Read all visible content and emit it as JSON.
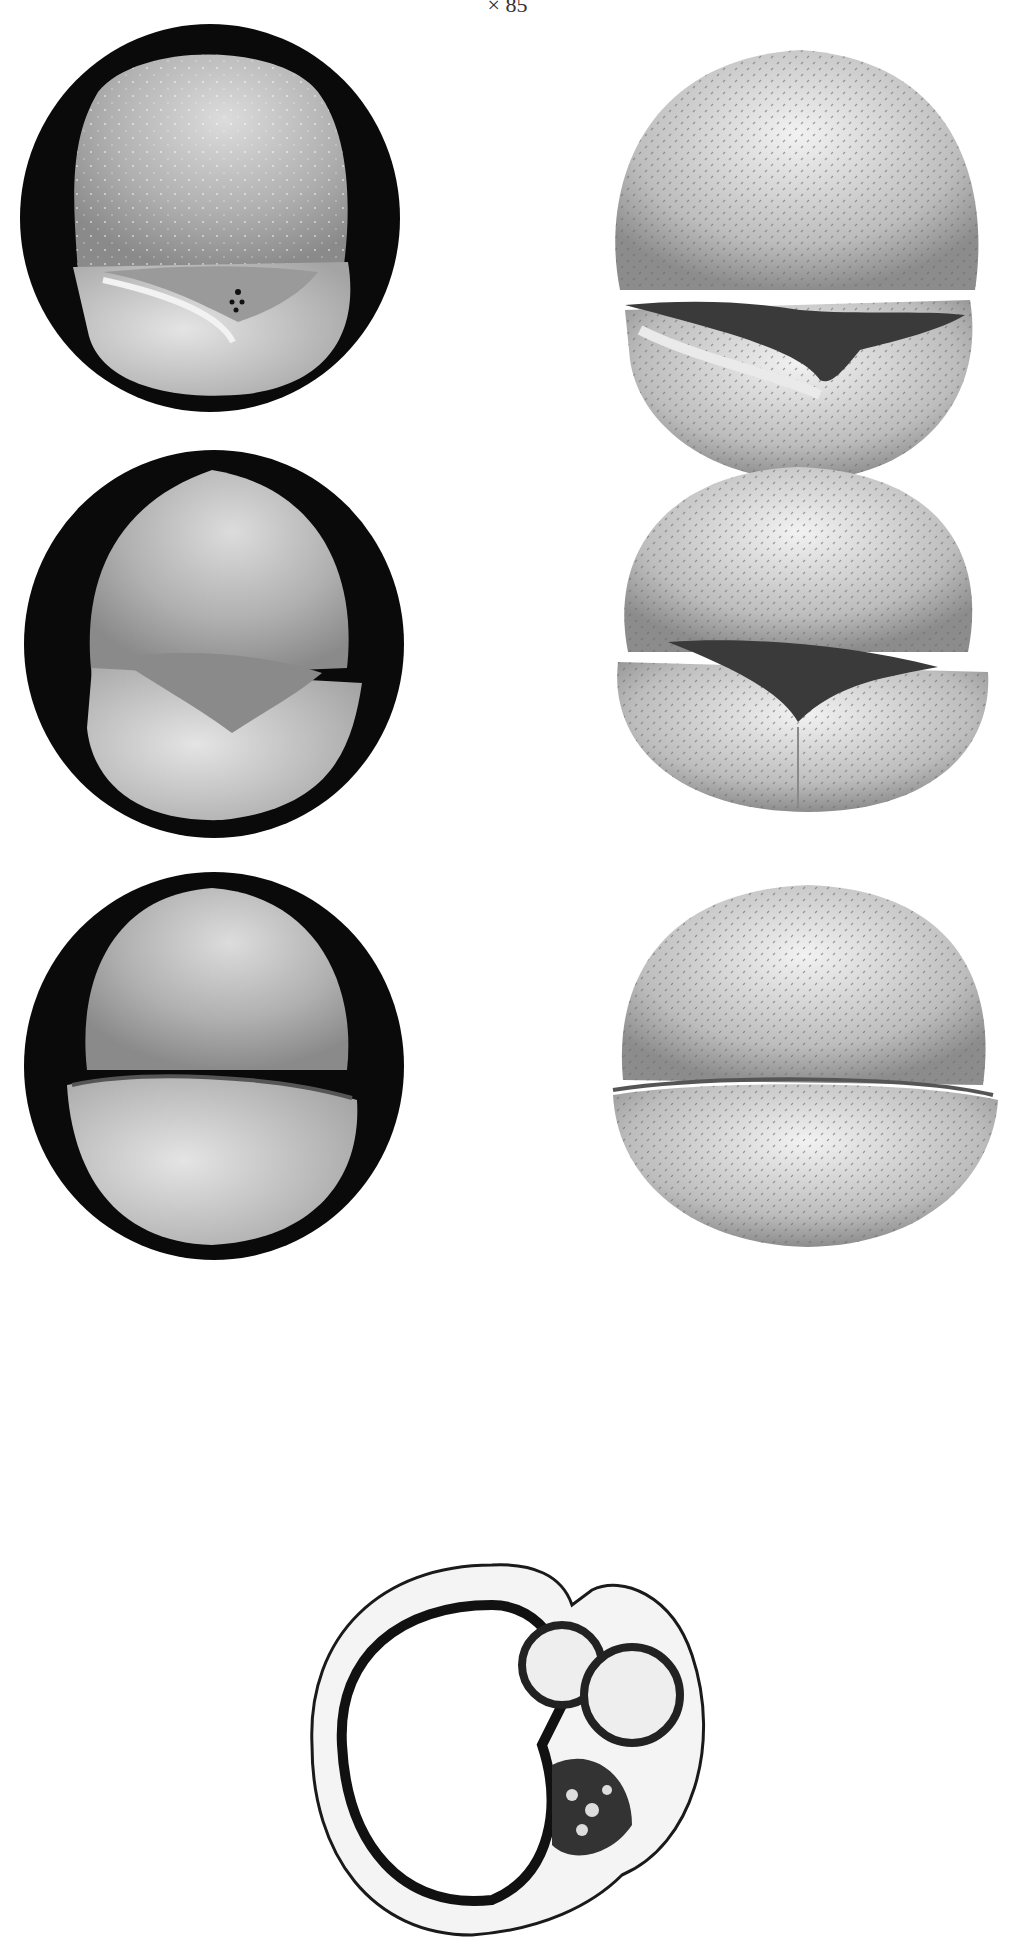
{
  "plate": {
    "magnification": "× 85",
    "figures": [
      {
        "id": "photo-1",
        "kind": "photograph",
        "view": "apertural view",
        "background": "black oval mount"
      },
      {
        "id": "drawing-1",
        "kind": "drawing",
        "view": "apertural view"
      },
      {
        "id": "photo-2",
        "kind": "photograph",
        "view": "apertural view",
        "background": "black oval mount"
      },
      {
        "id": "drawing-2",
        "kind": "drawing",
        "view": "apertural view"
      },
      {
        "id": "photo-3",
        "kind": "photograph",
        "view": "apertural view",
        "background": "black oval mount"
      },
      {
        "id": "drawing-3",
        "kind": "drawing",
        "view": "apertural view"
      },
      {
        "id": "thin-section",
        "kind": "photomicrograph",
        "view": "thin section"
      }
    ]
  },
  "colors": {
    "mount": "#0a0a0a",
    "shell_light": "#d9d9d9",
    "shell_mid": "#a8a8a8",
    "shell_dark": "#5a5a5a",
    "paper": "#ffffff"
  }
}
